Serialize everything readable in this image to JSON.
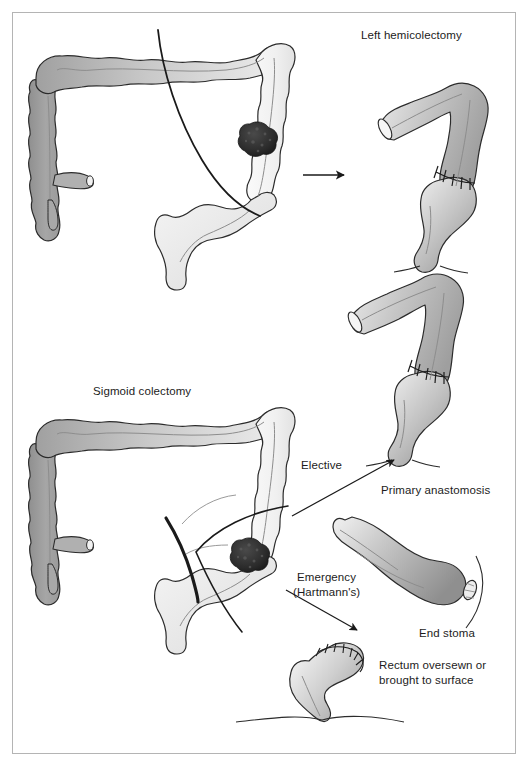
{
  "figure": {
    "title_left_hemicolectomy": "Left hemicolectomy",
    "title_sigmoid_colectomy": "Sigmoid colectomy",
    "label_elective": "Elective",
    "label_emergency": "Emergency",
    "label_emergency_sub": "(Hartmann's)",
    "label_primary_anastomosis": "Primary anastomosis",
    "label_end_stoma": "End stoma",
    "label_rectum_line1": "Rectum oversewn or",
    "label_rectum_line2": "brought to surface"
  },
  "colors": {
    "outline": "#2b2b2b",
    "frame": "#b4b4b4",
    "bowel_dark": "#9d9d9d",
    "bowel_mid": "#bdbdbd",
    "bowel_light": "#ededed",
    "bowel_pale": "#f7f7f7",
    "tumor": "#2e2e2e",
    "resection_line": "#1a1a1a",
    "arrow": "#1a1a1a",
    "background": "#ffffff"
  },
  "panels": [
    {
      "name": "upper-left-colon",
      "caption": "Large bowel with tumour in descending colon and resection line for left hemicolectomy"
    },
    {
      "name": "upper-right-specimen",
      "caption": "Post left hemicolectomy result with anastomosis"
    },
    {
      "name": "lower-left-colon",
      "caption": "Large bowel with tumour in sigmoid colon and resection lines for sigmoid colectomy"
    },
    {
      "name": "primary-anastomosis-specimen",
      "caption": "Colon with primary anastomosis after elective sigmoid colectomy"
    },
    {
      "name": "end-stoma-specimen",
      "caption": "Colon brought out as an end stoma"
    },
    {
      "name": "rectal-stump-specimen",
      "caption": "Oversewn rectal stump"
    }
  ],
  "annotations": {
    "arrow_hemicolectomy": "straight-arrow-right",
    "arrow_elective": "arrow-up-right",
    "arrow_emergency": "arrow-down-right"
  }
}
